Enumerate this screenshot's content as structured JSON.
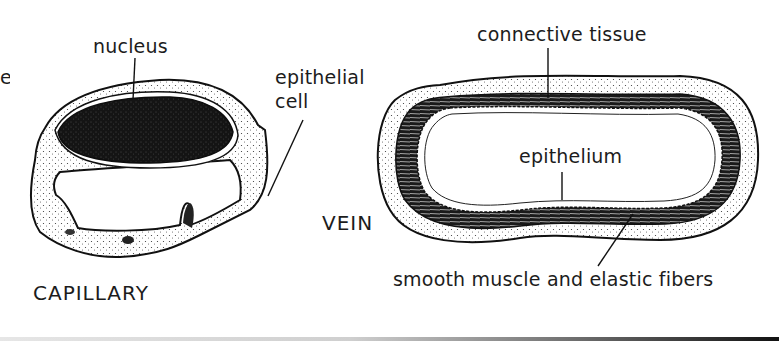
{
  "diagram": {
    "truncated_left_text": "e",
    "capillary": {
      "name": "CAPILLARY",
      "labels": {
        "nucleus": "nucleus",
        "epithelial_cell_line1": "epithelial",
        "epithelial_cell_line2": "cell"
      }
    },
    "vein": {
      "name": "VEIN",
      "labels": {
        "connective_tissue": "connective tissue",
        "epithelium": "epithelium",
        "smooth_muscle": "smooth muscle and elastic fibers"
      }
    },
    "colors": {
      "ink": "#111111",
      "paper": "#ffffff"
    }
  }
}
